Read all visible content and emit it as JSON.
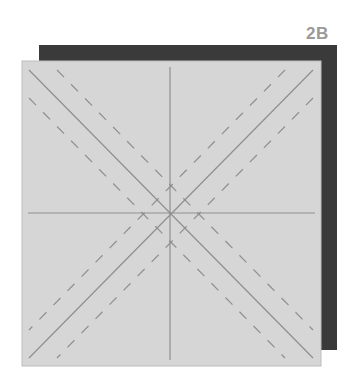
{
  "figure": {
    "label": "2B",
    "colors": {
      "back_square": "#3a3a3a",
      "front_square": "#d6d6d6",
      "front_border": "#bdbdbd",
      "lines": "#8f8f8f",
      "label": "#9a9a9a"
    }
  }
}
